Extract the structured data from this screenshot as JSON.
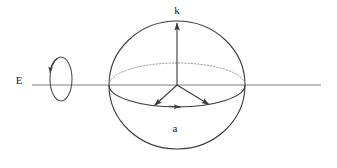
{
  "figure": {
    "type": "vector-diagram",
    "background_color": "#ffffff",
    "stroke_color": "#3a3a3a",
    "label_color": "#1a1a1a",
    "canvas": {
      "width": 337,
      "height": 168
    }
  },
  "labels": {
    "k": "k",
    "a": "a",
    "E": "E"
  },
  "geometry": {
    "sphere": {
      "center_x": 177,
      "center_y": 85,
      "radius_x": 68,
      "radius_y": 64
    },
    "equator": {
      "center_x": 177,
      "center_y": 85,
      "radius_x": 68,
      "radius_y": 22,
      "upper_arc_style": "dotted",
      "lower_arc_style": "solid"
    },
    "axis_line": {
      "x_start": 32,
      "x_end": 321,
      "y": 85
    },
    "rotation_ellipse": {
      "center_x": 61,
      "center_y": 79,
      "radius_x": 11,
      "radius_y": 22,
      "arrow_position": "top-left",
      "direction": "counterclockwise"
    },
    "vector_k": {
      "from_x": 177,
      "from_y": 85,
      "to_x": 177,
      "to_y": 22,
      "direction": "up"
    },
    "vector_left": {
      "from_x": 177,
      "from_y": 85,
      "to_x": 154,
      "to_y": 106,
      "direction": "down-left"
    },
    "vector_right": {
      "from_x": 177,
      "from_y": 85,
      "to_x": 209,
      "to_y": 105,
      "direction": "down-right"
    },
    "arc_arrow_a": {
      "x": 178,
      "y": 117,
      "direction": "right"
    }
  },
  "label_positions": {
    "k": {
      "x": 177,
      "y": 11
    },
    "a": {
      "x": 175,
      "y": 129
    },
    "E": {
      "x": 19,
      "y": 81
    }
  }
}
